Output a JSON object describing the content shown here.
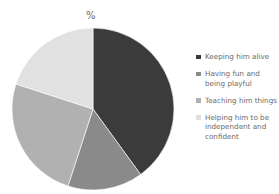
{
  "chart_data": {
    "type": "pie",
    "title": "%",
    "categories": [
      "Keeping him alive",
      "Having fun and being playful",
      "Teaching him things",
      "Helping him to be independent and confident"
    ],
    "values": [
      40,
      15,
      25,
      20
    ],
    "colors": [
      "#3b3b3b",
      "#8a8a8a",
      "#b1b1b1",
      "#e1e1e1"
    ],
    "start_angle": "12 o'clock, clockwise",
    "legend_position": "right"
  },
  "legend": {
    "items": [
      {
        "label": "Keeping him alive",
        "color": "#3b3b3b"
      },
      {
        "label": "Having fun and being playful",
        "color": "#8a8a8a"
      },
      {
        "label": "Teaching him things",
        "color": "#b1b1b1"
      },
      {
        "label": "Helping him to be independent and confident",
        "color": "#e1e1e1"
      }
    ]
  }
}
